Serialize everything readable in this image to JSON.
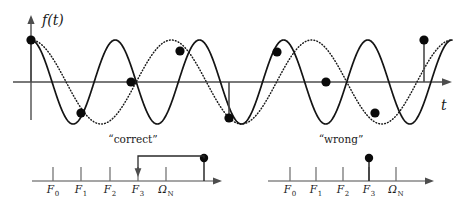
{
  "figure": {
    "title": "",
    "background_color": "#ffffff",
    "ink_color": "#1a1a1a"
  },
  "waveform_panel": {
    "y_axis_label": "f(t)",
    "x_axis_label": "t",
    "y_axis_icon": "up-arrow-icon",
    "x_axis_icon": "right-arrow-icon",
    "description": "Two sinusoids of different frequency passing through the same sample points",
    "series": [
      {
        "name": "solid-sinusoid",
        "style": "solid",
        "frequency_cycles": 5,
        "amplitude": 42,
        "phase_deg": 90
      },
      {
        "name": "dotted-sinusoid",
        "style": "dotted",
        "frequency_cycles": 3,
        "amplitude": 42,
        "phase_deg": 90
      }
    ],
    "samples": [
      {
        "index": 0,
        "x": 31,
        "y": 40,
        "stem": true
      },
      {
        "index": 1,
        "x": 81,
        "y": 113,
        "stem": false
      },
      {
        "index": 2,
        "x": 131,
        "y": 82,
        "stem": false
      },
      {
        "index": 3,
        "x": 180,
        "y": 51,
        "stem": false
      },
      {
        "index": 4,
        "x": 229,
        "y": 118,
        "stem": true
      },
      {
        "index": 5,
        "x": 277,
        "y": 52,
        "stem": false
      },
      {
        "index": 6,
        "x": 326,
        "y": 82,
        "stem": false
      },
      {
        "index": 7,
        "x": 375,
        "y": 113,
        "stem": false
      },
      {
        "index": 8,
        "x": 424,
        "y": 40,
        "stem": true
      }
    ],
    "baseline_y": 82,
    "x_start": 31,
    "x_end": 452
  },
  "chart_data": {
    "type": "line",
    "title": "",
    "xlabel": "t",
    "ylabel": "f(t)",
    "grid": false,
    "legend": "none",
    "series": [
      {
        "name": "correct signal (low frequency, dotted)",
        "style": "dotted",
        "cycles_over_span": 3,
        "amplitude": 1
      },
      {
        "name": "aliased signal (high frequency, solid)",
        "style": "solid",
        "cycles_over_span": 5,
        "amplitude": 1
      }
    ],
    "sample_values": [
      1,
      -0.707,
      0,
      0.707,
      -0.85,
      0.72,
      0,
      -0.72,
      1
    ],
    "sample_count": 9,
    "subplots": [
      {
        "type": "stem",
        "title": "“correct”",
        "categories": [
          "F_0",
          "F_1",
          "F_2",
          "F_3",
          "Ω_N",
          ""
        ],
        "stem_index": 5,
        "stem_value": 1,
        "annotation": "fold-back arrow from aliased line at right of Ω_N down to F_3"
      },
      {
        "type": "stem",
        "title": "“wrong”",
        "categories": [
          "F_0",
          "F_1",
          "F_2",
          "F_3",
          "Ω_N"
        ],
        "stem_index": 3,
        "stem_value": 1,
        "annotation": ""
      }
    ]
  },
  "spectrum_left": {
    "caption": "“correct”",
    "caption_x": 133,
    "caption_y": 143,
    "baseline_y": 181,
    "x_start": 32,
    "x_end": 222,
    "arrow_icon": "right-arrow-icon",
    "ticks": [
      {
        "x": 53,
        "base": "F",
        "sub": "0"
      },
      {
        "x": 81,
        "base": "F",
        "sub": "1"
      },
      {
        "x": 110,
        "base": "F",
        "sub": "2"
      },
      {
        "x": 138,
        "base": "F",
        "sub": "3"
      },
      {
        "x": 166,
        "base": "Ω",
        "sub": "N"
      }
    ],
    "stem": {
      "x": 204,
      "top_y": 158,
      "dot_radius": 4.2
    },
    "fold_arrow": {
      "from_x": 204,
      "to_x": 138,
      "y": 161,
      "head_y": 174,
      "icon": "down-arrow-icon"
    }
  },
  "spectrum_right": {
    "caption": "“wrong”",
    "caption_x": 341,
    "caption_y": 143,
    "baseline_y": 181,
    "x_start": 268,
    "x_end": 434,
    "arrow_icon": "right-arrow-icon",
    "ticks": [
      {
        "x": 290,
        "base": "F",
        "sub": "0"
      },
      {
        "x": 316,
        "base": "F",
        "sub": "1"
      },
      {
        "x": 343,
        "base": "F",
        "sub": "2"
      },
      {
        "x": 369,
        "base": "F",
        "sub": "3"
      },
      {
        "x": 396,
        "base": "Ω",
        "sub": "N"
      }
    ],
    "stem": {
      "x": 369,
      "top_y": 158,
      "dot_radius": 4.2
    }
  }
}
